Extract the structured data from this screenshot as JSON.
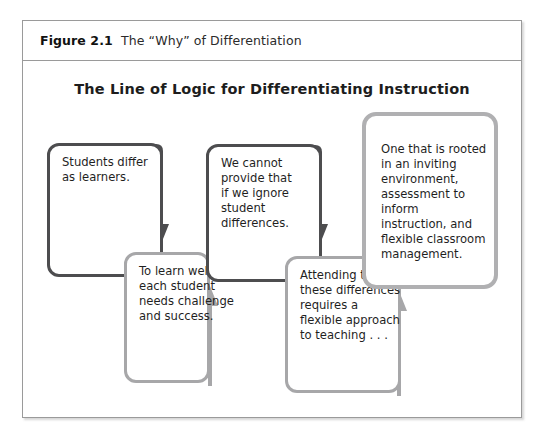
{
  "figure": {
    "label": "Figure 2.1",
    "caption": "The “Why” of Differentiation"
  },
  "diagram": {
    "title": "The Line of Logic for Differentiating Instruction",
    "type": "flowchart-zigzag",
    "colors": {
      "dark_border": "#4d4d4f",
      "light_border": "#a7a7a9",
      "pale_border": "#b0b0b2",
      "frame_border": "#9a9a9a",
      "text": "#1f1f1f",
      "background": "#ffffff"
    },
    "nodes": [
      {
        "id": "node-1",
        "order": 1,
        "text": "Students differ\nas learners.",
        "style": "dark"
      },
      {
        "id": "node-2",
        "order": 2,
        "text": "To learn well,\neach student\nneeds challenge\nand success.",
        "style": "light"
      },
      {
        "id": "node-3",
        "order": 3,
        "text": "We cannot\nprovide that\nif we ignore\nstudent\ndifferences.",
        "style": "dark"
      },
      {
        "id": "node-4",
        "order": 4,
        "text": "Attending to\nthese differences\nrequires a\nflexible approach\nto teaching . . .",
        "style": "light"
      },
      {
        "id": "node-5",
        "order": 5,
        "text": "One that is rooted\nin an inviting\nenvironment,\nassessment to inform\ninstruction, and\nflexible classroom\nmanagement.",
        "style": "pale"
      }
    ],
    "connectors": [
      {
        "id": "arrow-1-to-2",
        "from": "node-1",
        "to": "node-2",
        "direction": "down",
        "style": "dark"
      },
      {
        "id": "arrow-2-to-3",
        "from": "node-2",
        "to": "node-3",
        "direction": "up",
        "style": "light"
      },
      {
        "id": "arrow-3-to-4",
        "from": "node-3",
        "to": "node-4",
        "direction": "down",
        "style": "dark"
      },
      {
        "id": "arrow-4-to-5",
        "from": "node-4",
        "to": "node-5",
        "direction": "up",
        "style": "light"
      }
    ]
  }
}
